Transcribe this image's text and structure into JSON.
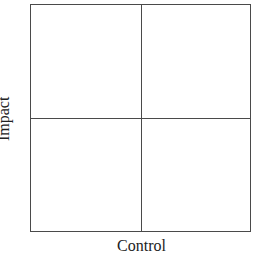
{
  "diagram": {
    "type": "2x2 matrix",
    "quadrants": [
      {
        "position": "top-left",
        "label": ""
      },
      {
        "position": "top-right",
        "label": ""
      },
      {
        "position": "bottom-left",
        "label": ""
      },
      {
        "position": "bottom-right",
        "label": ""
      }
    ],
    "x_axis_label": "Control",
    "y_axis_label": "Impact"
  }
}
